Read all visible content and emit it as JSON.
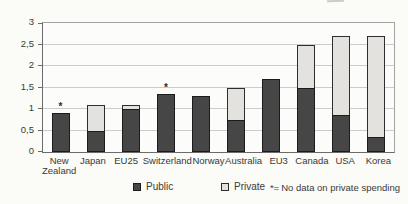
{
  "chart_data": {
    "type": "bar",
    "stacked": true,
    "categories": [
      "New Zealand",
      "Japan",
      "EU25",
      "Switzerland",
      "Norway",
      "Australia",
      "EU3",
      "Canada",
      "USA",
      "Korea"
    ],
    "series": [
      {
        "name": "Public",
        "color": "#464646",
        "values": [
          0.9,
          0.5,
          1.0,
          1.35,
          1.3,
          0.75,
          1.7,
          1.5,
          0.85,
          0.35
        ]
      },
      {
        "name": "Private",
        "color": "#e3e2df",
        "values": [
          0,
          0.6,
          0.1,
          0,
          0,
          0.75,
          0,
          1.0,
          1.85,
          2.35
        ]
      }
    ],
    "no_data_marker": "*",
    "no_data_markers": [
      true,
      false,
      false,
      true,
      false,
      false,
      false,
      false,
      false,
      false
    ],
    "ylim": [
      0,
      3
    ],
    "yticks": [
      {
        "value": 0,
        "label": "0"
      },
      {
        "value": 0.5,
        "label": "0,5"
      },
      {
        "value": 1,
        "label": "1"
      },
      {
        "value": 1.5,
        "label": "1,5"
      },
      {
        "value": 2,
        "label": "2"
      },
      {
        "value": 2.5,
        "label": "2,5"
      },
      {
        "value": 3,
        "label": "3"
      }
    ],
    "grid": true,
    "legend_position": "bottom",
    "xlabel": "",
    "ylabel": "",
    "title": ""
  },
  "footnote": {
    "marker": "*=",
    "text": "No data on private spending"
  },
  "colors": {
    "public": "#464646",
    "private": "#e3e2df",
    "gridline": "#ccccc9",
    "frame": "#a3a3a0",
    "axis": "#6b6b6b",
    "text": "#3a3a38",
    "background": "#fbfbf8"
  }
}
